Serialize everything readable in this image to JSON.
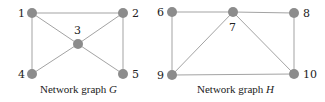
{
  "colors": {
    "node": "#8c8c8c",
    "edge": "#a3a3a3",
    "text": "#222222",
    "background": "#ffffff"
  },
  "graphs": [
    {
      "name": "G",
      "caption_prefix": "Network graph ",
      "caption_var": "G",
      "nodes": [
        {
          "id": "1",
          "label": "1",
          "x": 32,
          "y": 13
        },
        {
          "id": "2",
          "label": "2",
          "x": 123,
          "y": 13
        },
        {
          "id": "3",
          "label": "3",
          "x": 78,
          "y": 44
        },
        {
          "id": "4",
          "label": "4",
          "x": 32,
          "y": 74
        },
        {
          "id": "5",
          "label": "5",
          "x": 123,
          "y": 74
        }
      ],
      "edges": [
        [
          "1",
          "2"
        ],
        [
          "1",
          "4"
        ],
        [
          "1",
          "3"
        ],
        [
          "2",
          "3"
        ],
        [
          "2",
          "5"
        ],
        [
          "3",
          "4"
        ],
        [
          "3",
          "5"
        ]
      ]
    },
    {
      "name": "H",
      "caption_prefix": "Network graph ",
      "caption_var": "H",
      "nodes": [
        {
          "id": "6",
          "label": "6",
          "x": 172,
          "y": 12
        },
        {
          "id": "7",
          "label": "7",
          "x": 233,
          "y": 12
        },
        {
          "id": "8",
          "label": "8",
          "x": 294,
          "y": 13
        },
        {
          "id": "9",
          "label": "9",
          "x": 172,
          "y": 75
        },
        {
          "id": "10",
          "label": "10",
          "x": 294,
          "y": 74
        }
      ],
      "edges": [
        [
          "6",
          "7"
        ],
        [
          "7",
          "8"
        ],
        [
          "6",
          "9"
        ],
        [
          "9",
          "7"
        ],
        [
          "7",
          "10"
        ],
        [
          "8",
          "10"
        ],
        [
          "9",
          "10"
        ]
      ]
    }
  ]
}
